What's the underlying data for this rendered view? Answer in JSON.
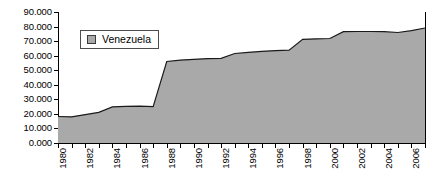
{
  "chart_data": {
    "type": "area",
    "title": "",
    "xlabel": "",
    "ylabel": "",
    "series": [
      {
        "name": "Venezuela",
        "color": "#a9a9a9",
        "values": [
          18.2,
          18.0,
          19.5,
          21.0,
          24.8,
          25.2,
          25.3,
          25.0,
          56.0,
          57.0,
          57.5,
          58.0,
          58.2,
          61.5,
          62.3,
          63.0,
          63.5,
          63.8,
          71.2,
          71.6,
          71.8,
          76.5,
          76.6,
          76.6,
          76.5,
          75.9,
          77.2,
          79.0
        ]
      }
    ],
    "x": [
      1980,
      1981,
      1982,
      1983,
      1984,
      1985,
      1986,
      1987,
      1988,
      1989,
      1990,
      1991,
      1992,
      1993,
      1994,
      1995,
      1996,
      1997,
      1998,
      1999,
      2000,
      2001,
      2002,
      2003,
      2004,
      2005,
      2006,
      2007
    ],
    "xtick_labels": [
      "1980",
      "1982",
      "1984",
      "1986",
      "1988",
      "1990",
      "1992",
      "1994",
      "1996",
      "1998",
      "2000",
      "2002",
      "2004",
      "2006"
    ],
    "ytick_labels": [
      "90.000",
      "80.000",
      "70.000",
      "60.000",
      "50.000",
      "40.000",
      "30.000",
      "20.000",
      "10.000",
      "0.000"
    ],
    "ytick_values": [
      90,
      80,
      70,
      60,
      50,
      40,
      30,
      20,
      10,
      0
    ],
    "ylim": [
      0,
      90
    ],
    "xlim": [
      1980,
      2007
    ],
    "grid": false,
    "legend": {
      "position": "top-left-inside",
      "entries": [
        {
          "label": "Venezuela",
          "swatch": "legend-swatch-icon",
          "color": "#a9a9a9"
        }
      ]
    },
    "axis_color": "#000000",
    "plot_background": "#ffffff"
  }
}
